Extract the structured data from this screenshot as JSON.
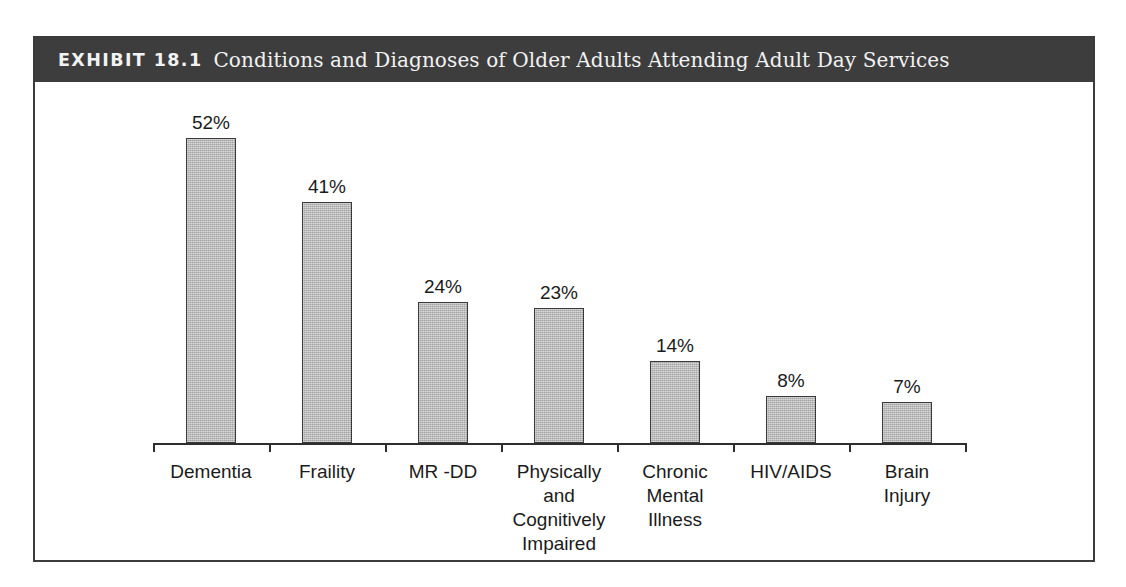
{
  "exhibit": {
    "label": "EXHIBIT 18.1",
    "title": "Conditions and Diagnoses of Older Adults Attending Adult Day Services",
    "header_bg": "#3d3d3d",
    "header_text_color": "#f2f2f2",
    "frame_border_color": "#3b3b3b"
  },
  "chart_data": {
    "type": "bar",
    "title": "Conditions and Diagnoses of Older Adults Attending Adult Day Services",
    "xlabel": "",
    "ylabel": "",
    "ylim": [
      0,
      60
    ],
    "grid": false,
    "legend": "none",
    "value_suffix": "%",
    "bar_fill_color": "#b4b4b4",
    "bar_border_color": "#3a3a3a",
    "axis_color": "#2e2e2e",
    "categories": [
      "Dementia",
      "Fraility",
      "MR -DD",
      "Physically and Cognitively Impaired",
      "Chronic Mental Illness",
      "HIV/AIDS",
      "Brain Injury"
    ],
    "category_lines": [
      [
        "Dementia"
      ],
      [
        "Fraility"
      ],
      [
        "MR -DD"
      ],
      [
        "Physically and",
        "Cognitively",
        "Impaired"
      ],
      [
        "Chronic",
        "Mental",
        "Illness"
      ],
      [
        "HIV/AIDS"
      ],
      [
        "Brain",
        "Injury"
      ]
    ],
    "values": [
      52,
      41,
      24,
      23,
      14,
      8,
      7
    ],
    "value_labels": [
      "52%",
      "41%",
      "24%",
      "23%",
      "14%",
      "8%",
      "7%"
    ]
  }
}
